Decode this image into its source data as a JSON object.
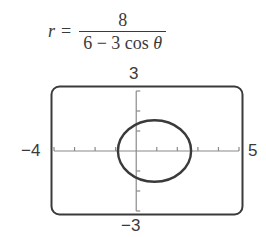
{
  "formula": {
    "lhs": "r",
    "equals": "=",
    "numerator": "8",
    "denominator_prefix": "6 − 3 cos ",
    "denominator_var": "θ"
  },
  "window": {
    "ymax_label": "3",
    "ymin_label": "−3",
    "xmin_label": "−4",
    "xmax_label": "5"
  },
  "colors": {
    "stroke": "#3a3a3a",
    "axis": "#8a8a8a"
  },
  "chart_data": {
    "type": "line",
    "plot_kind": "polar curve (ellipse)",
    "xlim": [
      -4,
      5
    ],
    "ylim": [
      -3,
      3
    ],
    "xlabel": "",
    "ylabel": "",
    "tick_labels": {
      "xmin": "−4",
      "xmax": "5",
      "ymin": "−3",
      "ymax": "3"
    },
    "x_ticks": [
      -4,
      -3,
      -2,
      -1,
      0,
      1,
      2,
      3,
      4,
      5
    ],
    "y_ticks": [
      -3,
      -2,
      -1,
      0,
      1,
      2,
      3
    ],
    "grid": false,
    "legend": null,
    "series": [
      {
        "name": "r = 8/(6 − 3cosθ)",
        "shape": "ellipse",
        "center": [
          0.89,
          0
        ],
        "semi_major_x": 1.78,
        "semi_minor_y": 1.54,
        "points": [
          {
            "theta": "0",
            "x": 2.67,
            "y": 0
          },
          {
            "theta": "π/2",
            "x": 0,
            "y": 1.33
          },
          {
            "theta": "π",
            "x": -0.89,
            "y": 0
          },
          {
            "theta": "3π/2",
            "x": 0,
            "y": -1.33
          }
        ]
      }
    ]
  }
}
